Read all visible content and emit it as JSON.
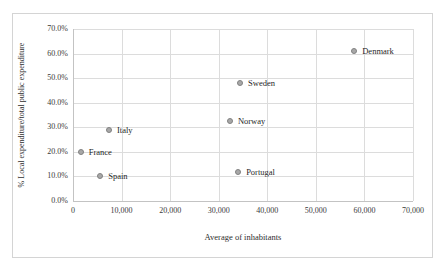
{
  "chart_data": {
    "type": "scatter",
    "title": "",
    "xlabel": "Average of inhabitants",
    "ylabel": "% Local expenditure/total public expenditure",
    "xlim": [
      0,
      70000
    ],
    "ylim": [
      0,
      70
    ],
    "grid": true,
    "legend": "none",
    "x_ticks": [
      0,
      10000,
      20000,
      30000,
      40000,
      50000,
      60000,
      70000
    ],
    "x_tick_labels": [
      "0",
      "10,000",
      "20,000",
      "30,000",
      "40,000",
      "50,000",
      "60,000",
      "70,000"
    ],
    "y_ticks": [
      0,
      10,
      20,
      30,
      40,
      50,
      60,
      70
    ],
    "y_tick_labels": [
      "0.0%",
      "10.0%",
      "20.0%",
      "30.0%",
      "40.0%",
      "50.0%",
      "60.0%",
      "70.0%"
    ],
    "points": [
      {
        "label": "France",
        "x": 1600,
        "y": 20.0
      },
      {
        "label": "Spain",
        "x": 5600,
        "y": 10.0
      },
      {
        "label": "Italy",
        "x": 7400,
        "y": 29.0
      },
      {
        "label": "Norway",
        "x": 32300,
        "y": 32.5
      },
      {
        "label": "Portugal",
        "x": 34000,
        "y": 12.0
      },
      {
        "label": "Sweden",
        "x": 34400,
        "y": 48.0
      },
      {
        "label": "Denmark",
        "x": 57900,
        "y": 61.0
      }
    ],
    "colors": {
      "marker_fill": "#a8a8a8",
      "marker_edge": "#818181",
      "gridline": "#dcdcdc",
      "axis_line": "#c3c3c3",
      "tick_text": "#3a3a3a",
      "point_label_text": "#1f1f1f",
      "frame_border": "#d4d4d4",
      "background": "#ffffff"
    }
  }
}
